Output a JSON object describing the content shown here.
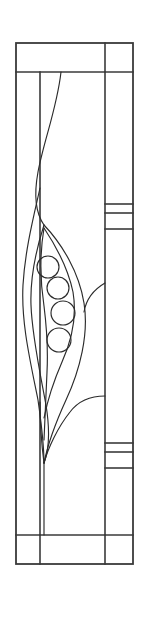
{
  "document": {
    "title": "Stained Glass Panel Design",
    "subject": "pea-pod-art-nouveau-leaded-window",
    "orientation": "portrait",
    "canvas": {
      "width": 144,
      "height": 617
    },
    "background_color": "#ffffff",
    "lead_color": "#2b2b2b",
    "frame_color": "#3a3a3a",
    "glass_color": "#ffffff"
  },
  "frame": {
    "outer": {
      "x": 16,
      "y": 43,
      "width": 117,
      "height": 521
    },
    "top_band": {
      "label": "top border band",
      "divider_y": 72,
      "vertical_divider_x": 105
    },
    "bottom_band": {
      "label": "bottom border band",
      "divider_y": 535,
      "vertical_divider_left_x": 40,
      "vertical_divider_right_x": 105
    },
    "right_column": {
      "label": "right border column",
      "divider_x": 105,
      "accent_bands": [
        {
          "name": "upper-accent-band",
          "top_y": 204,
          "mid_y": 213,
          "bottom_y": 229
        },
        {
          "name": "lower-accent-band",
          "top_y": 443,
          "mid_y": 452,
          "bottom_y": 468
        }
      ]
    },
    "inner_field": {
      "left_x": 40,
      "right_x": 105,
      "top_y": 72,
      "bottom_y": 535
    }
  },
  "motif": {
    "name": "pea-pod-with-leaves",
    "stem": {
      "name": "central-stem",
      "top_y": 463,
      "bottom_y": 535,
      "x": 44
    },
    "junction_upper": {
      "x": 44,
      "y": 225
    },
    "junction_lower": {
      "x": 44,
      "y": 463
    },
    "peas": [
      {
        "id": 1,
        "cx": 48,
        "cy": 267,
        "r": 11
      },
      {
        "id": 2,
        "cx": 58,
        "cy": 288,
        "r": 11
      },
      {
        "id": 3,
        "cx": 63,
        "cy": 313,
        "r": 12
      },
      {
        "id": 4,
        "cx": 59,
        "cy": 340,
        "r": 12
      }
    ],
    "pea_count": 4,
    "leaves": [
      {
        "name": "left-outer-leaf"
      },
      {
        "name": "left-inner-leaf"
      },
      {
        "name": "right-outer-leaf"
      },
      {
        "name": "pod-body"
      }
    ],
    "tendril": {
      "name": "upper-tendril",
      "start_y": 72,
      "end_y": 225
    }
  }
}
